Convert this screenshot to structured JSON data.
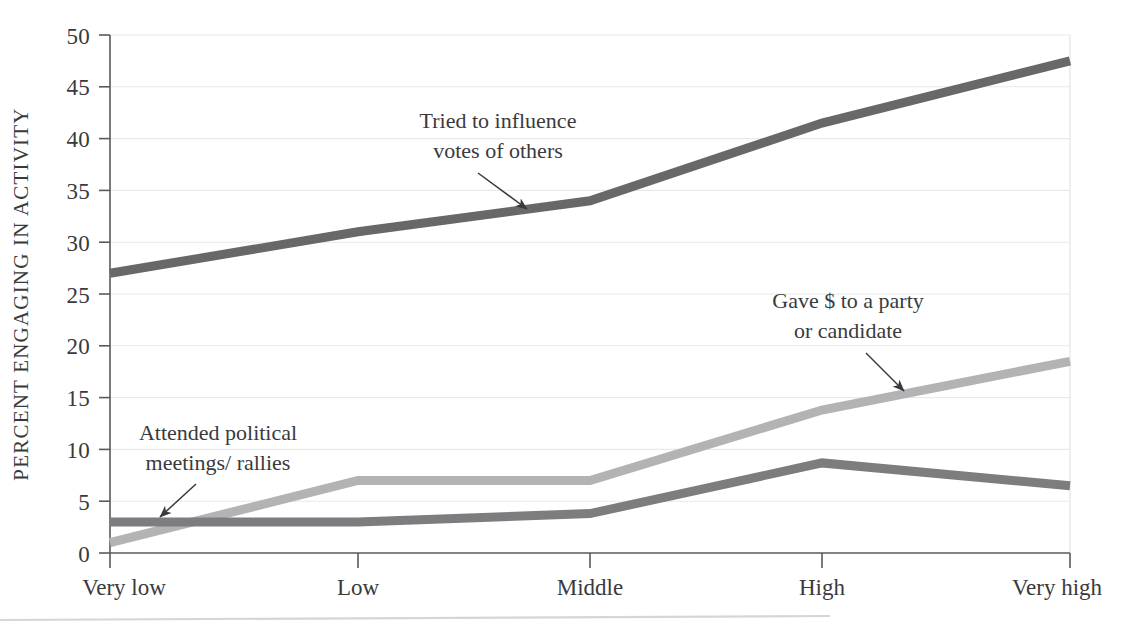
{
  "chart_data": {
    "type": "line",
    "title": "",
    "xlabel": "",
    "ylabel": "PERCENT ENGAGING IN ACTIVITY",
    "categories": [
      "Very low",
      "Low",
      "Middle",
      "High",
      "Very high"
    ],
    "ylim": [
      0,
      50
    ],
    "yticks": [
      0,
      5,
      10,
      15,
      20,
      25,
      30,
      35,
      40,
      45,
      50
    ],
    "ytick_labels": [
      "0",
      "5",
      "10",
      "15",
      "20",
      "25",
      "30",
      "35",
      "40",
      "45",
      "50"
    ],
    "grid": true,
    "legend_position": "inline-annotations",
    "series": [
      {
        "name": "Tried to influence votes of others",
        "values": [
          27,
          31,
          34,
          41.5,
          47.5
        ],
        "color": "#68686b",
        "width": 9
      },
      {
        "name": "Gave $ to a party or candidate",
        "values": [
          1,
          7,
          7,
          13.8,
          18.5
        ],
        "color": "#b3b3b5",
        "width": 9
      },
      {
        "name": "Attended political meetings/rallies",
        "values": [
          3,
          3,
          3.8,
          8.7,
          6.5
        ],
        "color": "#7d7d80",
        "width": 9
      }
    ],
    "annotations": [
      {
        "id": "influence",
        "line1": "Tried to influence",
        "line2": "votes of others",
        "text_x": 498,
        "text_y": 128,
        "arrow_from_x": 478,
        "arrow_from_y": 160,
        "arrow_to_x": 527,
        "arrow_to_y": 206
      },
      {
        "id": "gave-money",
        "line1": "Gave $ to a party",
        "line2": "or candidate",
        "text_x": 848,
        "text_y": 308,
        "arrow_from_x": 872,
        "arrow_from_y": 340,
        "arrow_to_x": 905,
        "arrow_to_y": 388
      },
      {
        "id": "meetings",
        "line1": "Attended political",
        "line2": "meetings/ rallies",
        "text_x": 218,
        "text_y": 440,
        "arrow_from_x": 198,
        "arrow_from_y": 472,
        "arrow_to_x": 159,
        "arrow_to_y": 515
      }
    ]
  },
  "axes": {
    "y_title": "PERCENT ENGAGING IN ACTIVITY"
  }
}
